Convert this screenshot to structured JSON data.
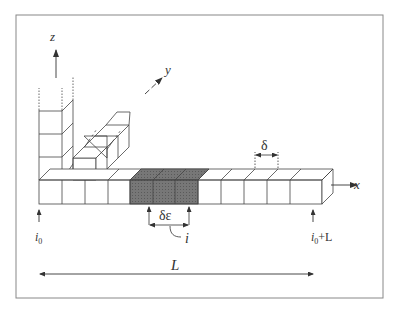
{
  "diagram": {
    "type": "discretized-lattice-schematic",
    "axes": {
      "x": "x",
      "y": "y",
      "z": "z"
    },
    "labels": {
      "cell_size": "δ",
      "segment_width": "δε",
      "segment_index": "i",
      "start_index": "i",
      "start_subscript": "0",
      "end_index": "i",
      "end_subscript": "0",
      "end_suffix": "+L",
      "length": "L"
    },
    "structure": {
      "x_row_cells": 13,
      "shaded_cells": 3,
      "shaded_start_cell": 4,
      "z_column_cells": 4,
      "y_row_cells": 4
    },
    "colors": {
      "line": "#444444",
      "shade": "#6e6e6e",
      "frame": "#888888",
      "background": "#ffffff"
    }
  }
}
